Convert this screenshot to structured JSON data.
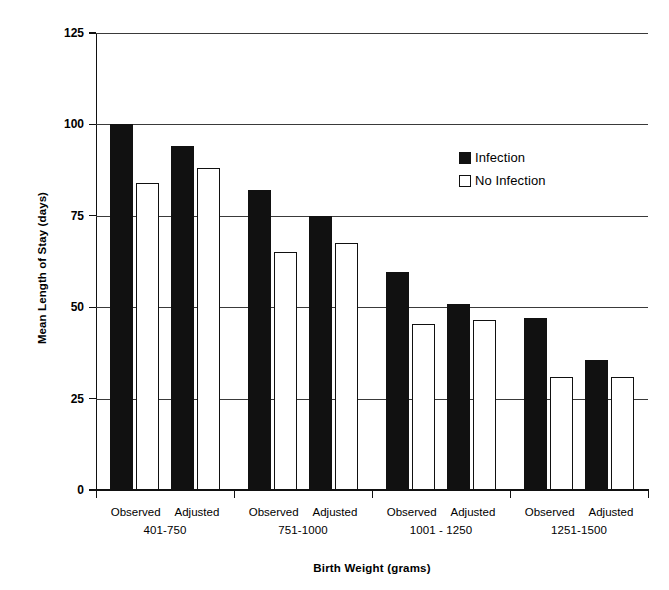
{
  "chart_data": {
    "type": "bar",
    "title": "",
    "xlabel": "Birth Weight (grams)",
    "ylabel": "Mean Length of Stay (days)",
    "ylim": [
      0,
      125
    ],
    "yticks": [
      0,
      25,
      50,
      75,
      100,
      125
    ],
    "grid": true,
    "legend_position": "upper right",
    "categories": [
      "Observed 401-750",
      "Adjusted 401-750",
      "Observed 751-1000",
      "Adjusted 751-1000",
      "Observed 1001 - 1250",
      "Adjusted 1001 - 1250",
      "Observed 1251-1500",
      "Adjusted 1251-1500"
    ],
    "groups": [
      {
        "range": "401-750",
        "subcategories": [
          "Observed",
          "Adjusted"
        ]
      },
      {
        "range": "751-1000",
        "subcategories": [
          "Observed",
          "Adjusted"
        ]
      },
      {
        "range": "1001 - 1250",
        "subcategories": [
          "Observed",
          "Adjusted"
        ]
      },
      {
        "range": "1251-1500",
        "subcategories": [
          "Observed",
          "Adjusted"
        ]
      }
    ],
    "series": [
      {
        "name": "Infection",
        "color": "#111111",
        "values": [
          100,
          94,
          82,
          75,
          59.5,
          51,
          47,
          35.5
        ]
      },
      {
        "name": "No Infection",
        "color": "#ffffff",
        "values": [
          84,
          88,
          65,
          67.5,
          45.5,
          46.5,
          31,
          31
        ]
      }
    ]
  },
  "legend": {
    "entries": [
      {
        "label": "Infection",
        "swatch": "filled-black-square"
      },
      {
        "label": "No Infection",
        "swatch": "open-white-square"
      }
    ]
  }
}
